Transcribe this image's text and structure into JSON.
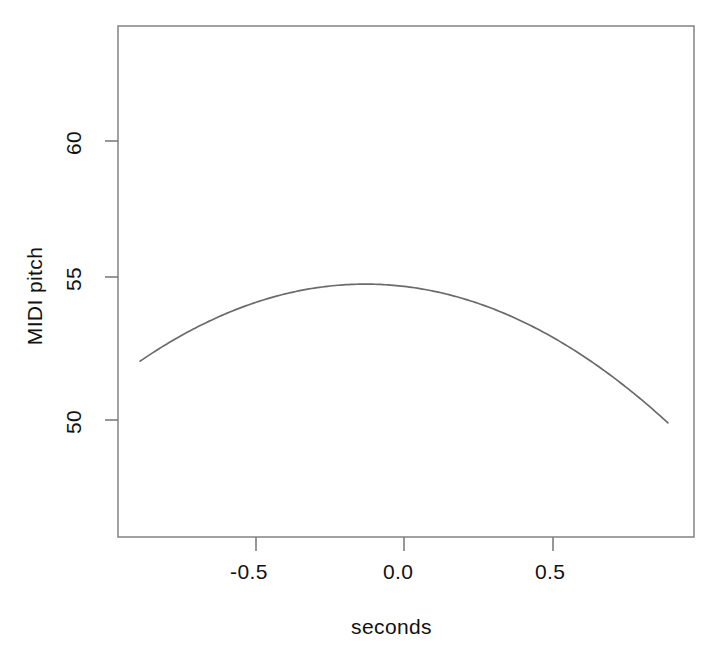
{
  "figure": {
    "background_color": "#ffffff",
    "line_color": "#6b6b6b",
    "axis_color": "#8a8a8a",
    "text_color": "#111111"
  },
  "axes": {
    "x_title": "seconds",
    "y_title": "MIDI pitch",
    "x_ticks": [
      "-0.5",
      "0.0",
      "0.5"
    ],
    "y_ticks": [
      "50",
      "55",
      "60"
    ]
  },
  "chart_data": {
    "type": "line",
    "title": "",
    "subtitle": "",
    "xlabel": "seconds",
    "ylabel": "MIDI pitch",
    "xlim": [
      -0.965,
      0.98
    ],
    "ylim": [
      47.65,
      63.6
    ],
    "xticks": [
      -0.5,
      0.0,
      0.5
    ],
    "xticklabels": [
      "-0.5",
      "0.0",
      "0.5"
    ],
    "yticks": [
      50,
      55,
      60
    ],
    "yticklabels": [
      "50",
      "55",
      "60"
    ],
    "grid": false,
    "legend": null,
    "annotations": [],
    "series": [
      {
        "name": "fitted pitch contour",
        "shape": "quadratic",
        "vertex_x": -0.13,
        "vertex_y": 54.87,
        "curvature": -4.78,
        "x": [
          -0.89,
          -0.8,
          -0.7,
          -0.6,
          -0.5,
          -0.4,
          -0.3,
          -0.2,
          -0.13,
          -0.1,
          0.0,
          0.1,
          0.2,
          0.3,
          0.4,
          0.5,
          0.6,
          0.7,
          0.8,
          0.89
        ],
        "y": [
          52.1,
          52.66,
          53.2,
          53.65,
          54.0,
          54.26,
          54.44,
          54.85,
          54.87,
          54.86,
          54.79,
          54.64,
          54.39,
          54.06,
          54.63,
          53.11,
          52.5,
          51.79,
          50.99,
          50.0
        ]
      }
    ]
  }
}
